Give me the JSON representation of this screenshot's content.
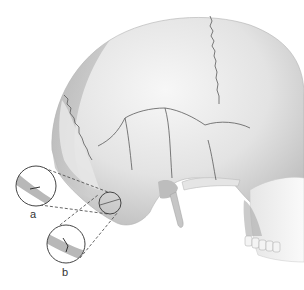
{
  "figure": {
    "labels": {
      "a": "a",
      "b": "b"
    },
    "colors": {
      "bone_light": "#ececec",
      "bone_mid": "#cfcfcf",
      "bone_dark": "#9a9a9a",
      "suture": "#555555",
      "inset_outline": "#444444",
      "dashed_line": "#555555",
      "fracture_band": "#b8b8b8"
    }
  }
}
